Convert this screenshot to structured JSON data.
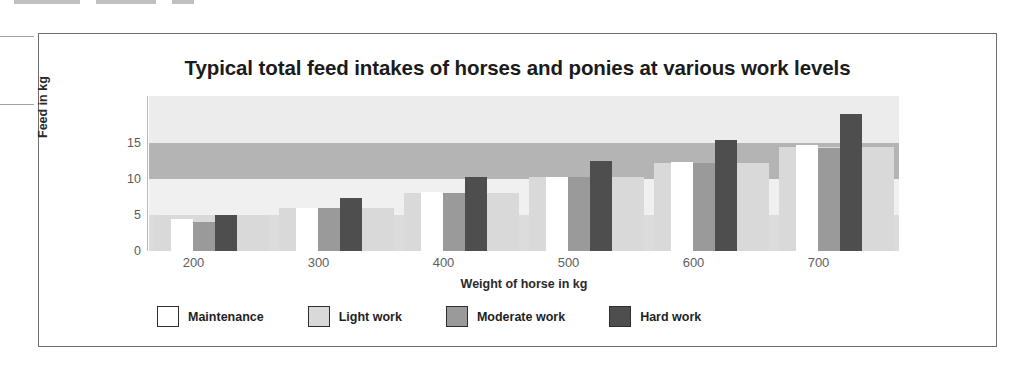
{
  "chart_data": {
    "type": "bar",
    "title": "Typical total feed intakes of horses and ponies at various work levels",
    "xlabel": "Weight of horse in kg",
    "ylabel": "Feed  in kg",
    "categories": [
      "200",
      "300",
      "400",
      "500",
      "600",
      "700"
    ],
    "series": [
      {
        "name": "Maintenance",
        "color": "#ffffff",
        "values": [
          4.5,
          6.0,
          8.2,
          10.3,
          12.3,
          14.7
        ]
      },
      {
        "name": "Light work",
        "color": "#d9d9d9",
        "values": [
          5.0,
          6.0,
          8.0,
          10.2,
          12.2,
          14.4
        ]
      },
      {
        "name": "Moderate work",
        "color": "#9a9a9a",
        "values": [
          4.0,
          6.0,
          8.0,
          10.2,
          12.2,
          14.3
        ]
      },
      {
        "name": "Hard work",
        "color": "#4e4e4e",
        "values": [
          5.0,
          7.4,
          10.2,
          12.5,
          15.4,
          19.0
        ]
      }
    ],
    "ylim": [
      0,
      21.5
    ],
    "yticks": [
      0,
      5,
      10,
      15
    ],
    "ytick_labels": [
      "0",
      "5",
      "10",
      "15"
    ],
    "grid": false,
    "legend_position": "bottom",
    "background_band_values": [
      5.0,
      10.0,
      15.0
    ],
    "band_colors": {
      "pale": "#f0f0f0",
      "light": "#dcdcdc",
      "mid": "#b4b4b4"
    }
  },
  "frame": {
    "border_color": "#6e6e6e"
  }
}
